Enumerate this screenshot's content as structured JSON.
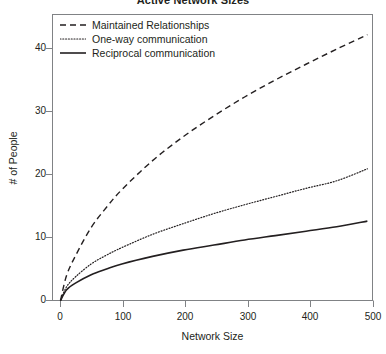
{
  "chart_data": {
    "type": "line",
    "title": "Active Network Sizes",
    "xlabel": "Network Size",
    "ylabel": "# of People",
    "xlim": [
      0,
      510
    ],
    "ylim": [
      0,
      44
    ],
    "xticks": [
      0,
      100,
      200,
      300,
      400,
      500
    ],
    "xtick_labels": [
      "0",
      "100",
      "200",
      "300",
      "400",
      "500"
    ],
    "yticks": [
      0,
      10,
      20,
      30,
      40
    ],
    "ytick_labels": [
      "0",
      "10",
      "20",
      "30",
      "40"
    ],
    "grid": false,
    "legend_position": "top-left",
    "x": [
      0,
      10,
      25,
      50,
      75,
      100,
      150,
      200,
      250,
      300,
      350,
      400,
      450,
      500
    ],
    "series": [
      {
        "name": "Maintained Relationships",
        "style": "dashed",
        "color": "#231f20",
        "values": [
          0,
          4.0,
          7.2,
          11.6,
          14.8,
          17.6,
          22.2,
          26.0,
          29.3,
          32.3,
          35.0,
          37.5,
          39.9,
          42.2
        ]
      },
      {
        "name": "One-way communication",
        "style": "dotted",
        "color": "#231f20",
        "values": [
          0,
          2.2,
          3.8,
          5.8,
          7.2,
          8.4,
          10.5,
          12.2,
          13.8,
          15.2,
          16.5,
          17.8,
          19.0,
          20.9
        ]
      },
      {
        "name": "Reciprocal communication",
        "style": "solid",
        "color": "#231f20",
        "values": [
          0,
          1.7,
          2.8,
          4.1,
          5.0,
          5.8,
          7.0,
          8.0,
          8.8,
          9.6,
          10.3,
          11.0,
          11.7,
          12.6
        ]
      }
    ]
  },
  "legend": {
    "items": [
      {
        "label": "Maintained Relationships"
      },
      {
        "label": "One-way communication"
      },
      {
        "label": "Reciprocal communication"
      }
    ]
  }
}
